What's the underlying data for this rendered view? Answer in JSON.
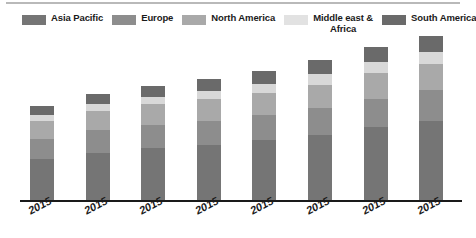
{
  "chart_data": {
    "type": "bar",
    "title": "",
    "subtitle": "",
    "xlabel": "",
    "ylabel": "",
    "stacked": true,
    "grid": false,
    "legend_position": "top",
    "axis_visible": {
      "x": true,
      "y": false
    },
    "ylim": [
      0,
      175
    ],
    "categories": [
      "2015",
      "2015",
      "2015",
      "2015",
      "2015",
      "2015",
      "2015",
      "2015"
    ],
    "series": [
      {
        "name": "Asia Pacific",
        "color": "#757575",
        "values": [
          45,
          52,
          57,
          60,
          65,
          71,
          79,
          86
        ]
      },
      {
        "name": "Europe",
        "color": "#8d8d8d",
        "values": [
          22,
          24,
          25,
          26,
          27,
          29,
          31,
          33
        ]
      },
      {
        "name": "North America",
        "color": "#a9a9a9",
        "values": [
          19,
          21,
          22,
          23,
          24,
          25,
          27,
          28
        ]
      },
      {
        "name": "Middle east & Africa",
        "color": "#d8d8d8",
        "values": [
          6,
          7,
          8,
          9,
          10,
          11,
          12,
          13
        ]
      },
      {
        "name": "South America",
        "color": "#6a6a6a",
        "values": [
          10,
          11,
          12,
          13,
          14,
          15,
          16,
          17
        ]
      }
    ],
    "totals": [
      102,
      115,
      124,
      131,
      140,
      151,
      165,
      177
    ]
  },
  "legend": {
    "items": [
      {
        "label": "Asia Pacific",
        "color": "#757575",
        "wrap": false
      },
      {
        "label": "Europe",
        "color": "#8d8d8d",
        "wrap": false
      },
      {
        "label": "North America",
        "color": "#a9a9a9",
        "wrap": false
      },
      {
        "label": "Middle east & Africa",
        "color": "#e2e2e2",
        "wrap": true
      },
      {
        "label": "South America",
        "color": "#6a6a6a",
        "wrap": false
      }
    ]
  },
  "colors": {
    "background": "#ffffff",
    "axis": "#1a1a1a",
    "top_rule": "#b9b9b9",
    "text": "#1a1a1a"
  }
}
